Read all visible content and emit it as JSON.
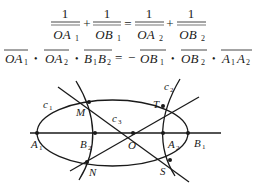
{
  "equations": {
    "eq1": {
      "terms": [
        {
          "num": "1",
          "den": "OA",
          "sub": "1"
        },
        {
          "num": "1",
          "den": "OB",
          "sub": "1"
        },
        {
          "num": "1",
          "den": "OA",
          "sub": "2"
        },
        {
          "num": "1",
          "den": "OB",
          "sub": "2"
        }
      ],
      "ops": [
        "+",
        "=",
        "+"
      ]
    },
    "eq2": {
      "terms": [
        {
          "base": "OA",
          "sub": "1"
        },
        {
          "base": "OA",
          "sub": "2"
        },
        {
          "base": "B",
          "sub": "1",
          "base2": "B",
          "sub2": "2"
        },
        {
          "base": "OB",
          "sub": "1"
        },
        {
          "base": "OB",
          "sub": "2"
        },
        {
          "base": "A",
          "sub": "1",
          "base2": "A",
          "sub2": "2"
        }
      ],
      "dot": "•",
      "equals": "=",
      "minus": "−"
    }
  },
  "diagram": {
    "curves": {
      "c1": {
        "label": "c",
        "sub": "1"
      },
      "c2": {
        "label": "c",
        "sub": "2"
      },
      "c3": {
        "label": "c",
        "sub": "3"
      }
    },
    "points": {
      "A1": {
        "label": "A",
        "sub": "1"
      },
      "B2": {
        "label": "B",
        "sub": "2"
      },
      "O": {
        "label": "O"
      },
      "A2": {
        "label": "A",
        "sub": "2"
      },
      "B1": {
        "label": "B",
        "sub": "1"
      },
      "M": {
        "label": "M"
      },
      "N": {
        "label": "N"
      },
      "T": {
        "label": "T"
      },
      "S": {
        "label": "S"
      }
    }
  }
}
